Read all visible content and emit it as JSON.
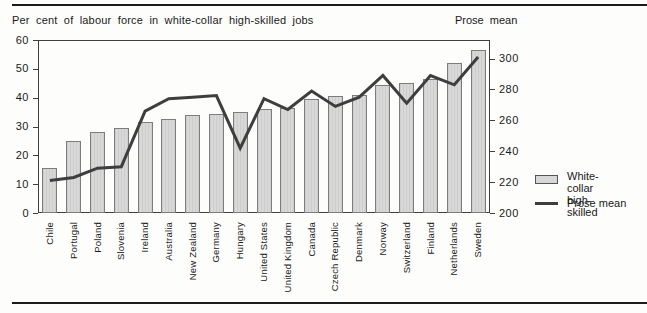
{
  "titles": {
    "left": "Per cent of labour force in white-collar high-skilled jobs",
    "right": "Prose mean"
  },
  "legend": {
    "bar": {
      "line1": "White-collar",
      "line2": "high-skilled"
    },
    "line": {
      "label": "Prose mean"
    }
  },
  "chart_data": {
    "type": "bar",
    "subtype": "bar-with-line-overlay",
    "title": "Per cent of labour force in white-collar high-skilled jobs",
    "right_axis_title": "Prose mean",
    "categories": [
      "Chile",
      "Portugal",
      "Poland",
      "Slovenia",
      "Ireland",
      "Australia",
      "New Zealand",
      "Germany",
      "Hungary",
      "United States",
      "United Kingdom",
      "Canada",
      "Czech Republic",
      "Denmark",
      "Norway",
      "Switzerland",
      "Finland",
      "Netherlands",
      "Sweden"
    ],
    "series": [
      {
        "name": "White-collar high-skilled",
        "type": "bar",
        "axis": "left",
        "values": [
          15.5,
          25,
          28,
          29.5,
          31.5,
          32.5,
          34,
          34.5,
          35,
          36,
          36.5,
          39.5,
          40.5,
          41,
          44.5,
          45,
          46.5,
          52,
          56.5
        ]
      },
      {
        "name": "Prose mean",
        "type": "line",
        "axis": "right",
        "values": [
          221,
          223,
          229,
          230,
          266,
          274,
          275,
          276,
          242,
          274,
          267,
          279,
          269,
          275,
          289,
          271,
          289,
          283,
          301
        ]
      }
    ],
    "left_axis": {
      "label": "Per cent",
      "min": 0,
      "max": 60,
      "ticks": [
        0,
        10,
        20,
        30,
        40,
        50,
        60
      ]
    },
    "right_axis": {
      "label": "Prose mean",
      "min": 200,
      "max": 312,
      "ticks": [
        200,
        220,
        240,
        260,
        280,
        300
      ]
    },
    "grid": false,
    "legend_position": "right",
    "colors": {
      "bar_fill": "#d7d7d7",
      "bar_border": "#7d7d7d",
      "line": "#3e3e3e"
    }
  }
}
